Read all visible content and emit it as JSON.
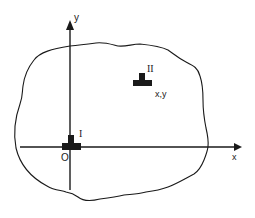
{
  "diagram": {
    "type": "coordinate-frame",
    "colors": {
      "ink": "#1a1a1a",
      "background": "#ffffff"
    },
    "axes": {
      "x_label": "x",
      "y_label": "y",
      "origin_label": "O"
    },
    "objects": [
      {
        "id": "I",
        "label": "I",
        "shape": "inverted-T",
        "position": "origin"
      },
      {
        "id": "II",
        "label": "II",
        "shape": "inverted-T",
        "position_label": "x,y"
      }
    ],
    "region": {
      "shape": "irregular closed outline"
    }
  }
}
